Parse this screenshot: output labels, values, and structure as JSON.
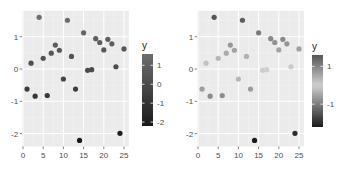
{
  "chart_data": [
    {
      "type": "scatter",
      "title": "",
      "xlabel": "",
      "ylabel": "",
      "x": [
        1,
        2,
        3,
        4,
        5,
        6,
        7,
        8,
        9,
        10,
        11,
        12,
        13,
        14,
        15,
        16,
        17,
        18,
        19,
        20,
        21,
        22,
        23,
        24,
        25
      ],
      "y": [
        -0.62,
        0.18,
        -0.84,
        1.6,
        0.33,
        -0.82,
        0.49,
        0.74,
        0.58,
        -0.31,
        1.51,
        0.39,
        -0.62,
        -2.21,
        1.12,
        -0.04,
        -0.02,
        0.94,
        0.82,
        0.59,
        0.92,
        0.78,
        0.07,
        -1.99,
        0.62
      ],
      "color_by": "y",
      "xlim": [
        -0.2,
        26.2
      ],
      "ylim": [
        -2.4,
        1.8
      ],
      "x_ticks": [
        "0",
        "5",
        "10",
        "15",
        "20",
        "25"
      ],
      "y_ticks": [
        "-2",
        "-1",
        "0",
        "1"
      ],
      "grid": true,
      "legend": {
        "title": "y",
        "position": "right",
        "type": "colorbar",
        "ticks": [
          "1",
          "0",
          "-1",
          "-2"
        ],
        "scale": "sequential",
        "low_color": "#1a1a1a",
        "high_color": "#6e6e6e"
      }
    },
    {
      "type": "scatter",
      "title": "",
      "xlabel": "",
      "ylabel": "",
      "x": [
        1,
        2,
        3,
        4,
        5,
        6,
        7,
        8,
        9,
        10,
        11,
        12,
        13,
        14,
        15,
        16,
        17,
        18,
        19,
        20,
        21,
        22,
        23,
        24,
        25
      ],
      "y": [
        -0.62,
        0.18,
        -0.84,
        1.6,
        0.33,
        -0.82,
        0.49,
        0.74,
        0.58,
        -0.31,
        1.51,
        0.39,
        -0.62,
        -2.21,
        1.12,
        -0.04,
        -0.02,
        0.94,
        0.82,
        0.59,
        0.92,
        0.78,
        0.07,
        -1.99,
        0.62
      ],
      "color_by": "y",
      "xlim": [
        -0.2,
        26.2
      ],
      "ylim": [
        -2.4,
        1.8
      ],
      "x_ticks": [
        "0",
        "5",
        "10",
        "15",
        "20",
        "25"
      ],
      "y_ticks": [
        "-2",
        "-1",
        "0",
        "1"
      ],
      "grid": true,
      "legend": {
        "title": "y",
        "position": "right",
        "type": "colorbar",
        "ticks": [
          "1",
          "-1"
        ],
        "scale": "diverging",
        "low_color": "#1a1a1a",
        "mid_color": "#d0d0d0",
        "high_color": "#555555",
        "midpoint": 0
      }
    }
  ],
  "colors": {
    "panel_bg": "#ebebeb",
    "grid_major": "#ffffff",
    "tick_text": "#4d4d4d"
  }
}
